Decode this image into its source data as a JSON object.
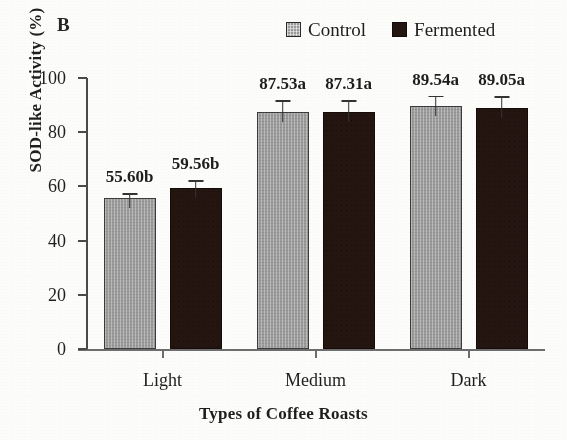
{
  "figure": {
    "panel_label": "B",
    "background_color": "#fcfcfa"
  },
  "legend": {
    "position": "top-right",
    "items": [
      {
        "label": "Control",
        "color": "#9c9c9c"
      },
      {
        "label": "Fermented",
        "color": "#241511"
      }
    ]
  },
  "axes": {
    "y_title": "SOD-like Activity (%)",
    "x_title": "Types of Coffee Roasts",
    "y_ticks": [
      "0",
      "20",
      "40",
      "60",
      "80",
      "100"
    ],
    "x_categories": [
      "Light",
      "Medium",
      "Dark"
    ]
  },
  "chart_data": {
    "type": "bar",
    "title": "B",
    "xlabel": "Types of Coffee Roasts",
    "ylabel": "SOD-like Activity (%)",
    "ylim": [
      0,
      100
    ],
    "ytick_values": [
      0,
      20,
      40,
      60,
      80,
      100
    ],
    "grid": false,
    "legend_position": "top-right",
    "categories": [
      "Light",
      "Medium",
      "Dark"
    ],
    "series": [
      {
        "name": "Control",
        "color": "#9c9c9c",
        "values": [
          55.6,
          87.53,
          89.54
        ],
        "errors": [
          1.9,
          4.2,
          4.0
        ],
        "data_labels": [
          "55.60b",
          "87.53a",
          "89.54a"
        ]
      },
      {
        "name": "Fermented",
        "color": "#241511",
        "values": [
          59.56,
          87.31,
          89.05
        ],
        "errors": [
          2.8,
          4.4,
          4.2
        ],
        "data_labels": [
          "59.56b",
          "87.31a",
          "89.05a"
        ]
      }
    ],
    "annotations": [
      "Letters a/b denote statistical significance groupings"
    ]
  }
}
